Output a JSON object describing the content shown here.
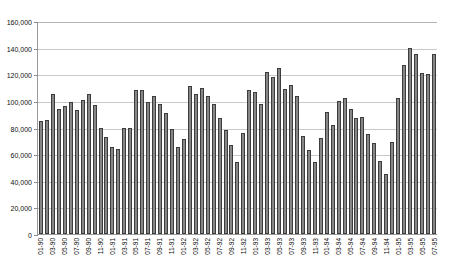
{
  "chart_data": {
    "type": "bar",
    "title": "",
    "subtitle": "",
    "xlabel": "",
    "ylabel": "",
    "ylim": [
      0,
      160000
    ],
    "ytick_step": 20000,
    "ytick_labels": [
      "160,000",
      "140,000",
      "120,000",
      "100,000",
      "80,000",
      "60,000",
      "40,000",
      "20,000",
      "0"
    ],
    "ytick_values": [
      160000,
      140000,
      120000,
      100000,
      80000,
      60000,
      40000,
      20000,
      0
    ],
    "grid": true,
    "grid_axis": "y",
    "legend": false,
    "legend_position": "none",
    "bar_color": "#878787",
    "bar_edge_color": "#3c3c3c",
    "axis_color": "#9a9a9a",
    "grid_color": "#c9c9c9",
    "background_color": "#ffffff",
    "label_every_n": 2,
    "categories": [
      "01-90",
      "02-90",
      "03-90",
      "04-90",
      "05-90",
      "06-90",
      "07-90",
      "08-90",
      "09-90",
      "10-90",
      "11-90",
      "12-90",
      "01-91",
      "02-91",
      "03-91",
      "04-91",
      "05-91",
      "06-91",
      "07-91",
      "08-91",
      "09-91",
      "10-91",
      "11-91",
      "12-91",
      "01-92",
      "02-92",
      "03-92",
      "04-92",
      "05-92",
      "06-92",
      "07-92",
      "08-92",
      "09-92",
      "10-92",
      "11-92",
      "12-92",
      "01-93",
      "02-93",
      "03-93",
      "04-93",
      "05-93",
      "06-93",
      "07-93",
      "08-93",
      "09-93",
      "10-93",
      "11-93",
      "12-93",
      "01-94",
      "02-94",
      "03-94",
      "04-94",
      "05-94",
      "06-94",
      "07-94",
      "08-94",
      "09-94",
      "10-94",
      "11-94",
      "12-94",
      "01-95",
      "02-95",
      "03-95",
      "04-95",
      "05-95",
      "06-95",
      "07-95"
    ],
    "tick_labels_shown": [
      "01-90",
      "03-90",
      "05-90",
      "07-90",
      "09-90",
      "11-90",
      "01-91",
      "03-91",
      "05-91",
      "07-91",
      "09-91",
      "11-91",
      "01-92",
      "02-92",
      "04-92",
      "06-92",
      "08-92",
      "10-92",
      "01-93",
      "03-93",
      "05-93",
      "07-93",
      "09-93",
      "11-93",
      "01-94",
      "03-94",
      "05-94",
      "07-94",
      "09-94",
      "11-94",
      "01-95",
      "03-95",
      "05-95",
      "07-95"
    ],
    "values": [
      85000,
      86000,
      105000,
      94000,
      96000,
      99000,
      93000,
      101000,
      105000,
      97000,
      80000,
      73000,
      65000,
      64000,
      80000,
      80000,
      108000,
      108000,
      99000,
      104000,
      98000,
      91000,
      79000,
      65000,
      71000,
      111000,
      105000,
      110000,
      104000,
      98000,
      87000,
      78000,
      67000,
      54000,
      76000,
      108000,
      107000,
      98000,
      122000,
      118000,
      125000,
      109000,
      112000,
      104000,
      74000,
      63000,
      54000,
      72000,
      92000,
      82000,
      100000,
      102000,
      94000,
      87000,
      88000,
      75000,
      68000,
      55000,
      45000,
      69000,
      102000,
      127000,
      140000,
      135000,
      121000,
      120000,
      135000
    ],
    "n_bars": 67,
    "value_range": [
      45000,
      140000
    ],
    "series_name": ""
  }
}
